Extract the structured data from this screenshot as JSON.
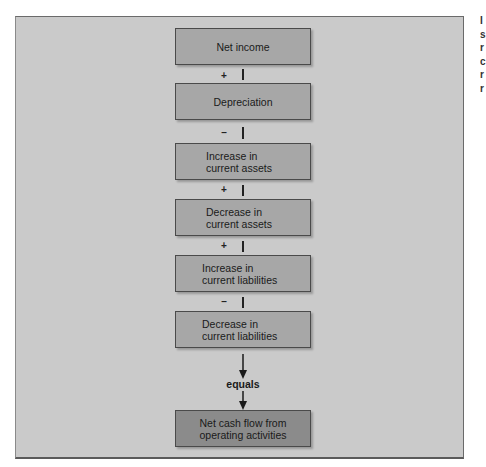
{
  "diagram": {
    "title": "",
    "steps": [
      {
        "id": "net-income",
        "lines": [
          "Net income"
        ]
      },
      {
        "id": "depreciation",
        "operator": "+",
        "lines": [
          "Depreciation"
        ]
      },
      {
        "id": "increase-current-assets",
        "operator": "–",
        "lines": [
          "Increase in",
          "current assets"
        ]
      },
      {
        "id": "decrease-current-assets",
        "operator": "+",
        "lines": [
          "Decrease in",
          "current assets"
        ]
      },
      {
        "id": "increase-current-liabilities",
        "operator": "+",
        "lines": [
          "Increase in",
          "current liabilities"
        ]
      },
      {
        "id": "decrease-current-liabilities",
        "operator": "–",
        "lines": [
          "Decrease in",
          "current liabilities"
        ]
      }
    ],
    "equals_label": "equals",
    "result": {
      "id": "net-cash-flow",
      "lines": [
        "Net cash flow from",
        "operating activities"
      ]
    },
    "colors": {
      "background": "#cacaca",
      "box_fill": "#a7a7a7",
      "result_fill": "#8b8b8b",
      "border": "#4a4a4a"
    }
  },
  "cropped_edge_text": [
    "I",
    "s",
    "r",
    "c",
    "r",
    "r"
  ]
}
